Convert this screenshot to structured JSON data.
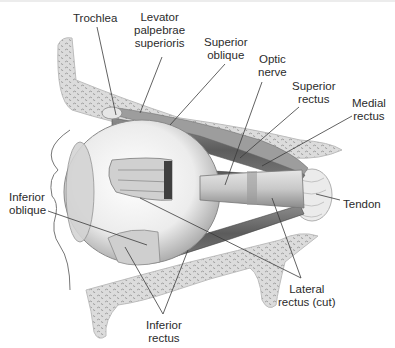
{
  "figure": {
    "type": "anatomical-diagram",
    "colors": {
      "background": "#ffffff",
      "bone": "#d9d9d9",
      "bone_texture": "#9a9a9a",
      "muscle": "#6e6e6e",
      "eyeball": "#f2f2f2",
      "leader_line": "#3a3a3a",
      "label_text": "#2b2b2b"
    }
  },
  "labels": {
    "trochlea": {
      "lines": [
        "Trochlea"
      ]
    },
    "levator": {
      "lines": [
        "Levator",
        "palpebrae",
        "superioris"
      ]
    },
    "superior_oblique": {
      "lines": [
        "Superior",
        "oblique"
      ]
    },
    "optic_nerve": {
      "lines": [
        "Optic",
        "nerve"
      ]
    },
    "superior_rectus": {
      "lines": [
        "Superior",
        "rectus"
      ]
    },
    "medial_rectus": {
      "lines": [
        "Medial",
        "rectus"
      ]
    },
    "tendon": {
      "lines": [
        "Tendon"
      ]
    },
    "inferior_oblique": {
      "lines": [
        "Inferior",
        "oblique"
      ]
    },
    "lateral_rectus": {
      "lines": [
        "Lateral",
        "rectus (cut)"
      ]
    },
    "inferior_rectus": {
      "lines": [
        "Inferior",
        "rectus"
      ]
    }
  }
}
